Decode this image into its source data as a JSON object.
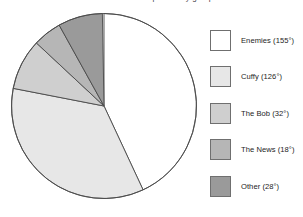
{
  "figure": {
    "caption_fragment": "distribution of responses by group",
    "background": "#ffffff"
  },
  "chart_data": {
    "type": "pie",
    "title": "",
    "xlabel": "",
    "ylabel": "",
    "units": "degrees",
    "start_angle_deg": 0,
    "direction": "clockwise",
    "total_degrees": 359,
    "grid": false,
    "legend_position": "right",
    "categories": [
      "Enemies",
      "Cuffy",
      "The Bob",
      "The News",
      "Other"
    ],
    "values": [
      155,
      126,
      32,
      18,
      28
    ],
    "value_labels": [
      "155°",
      "126°",
      "32°",
      "18°",
      "28°"
    ],
    "colors": [
      "#ffffff",
      "#e7e7e7",
      "#cfcfcf",
      "#b6b6b6",
      "#9a9a9a"
    ],
    "slice_edge_color": "#4a4a4a",
    "slices": [
      {
        "label": "Enemies",
        "degrees": 155,
        "legend_text": "Enemies (155°)",
        "color": "#ffffff"
      },
      {
        "label": "Cuffy",
        "degrees": 126,
        "legend_text": "Cuffy (126°)",
        "color": "#e7e7e7"
      },
      {
        "label": "The Bob",
        "degrees": 32,
        "legend_text": "The Bob (32°)",
        "color": "#cfcfcf"
      },
      {
        "label": "The News",
        "degrees": 18,
        "legend_text": "The News (18°)",
        "color": "#b6b6b6"
      },
      {
        "label": "Other",
        "degrees": 28,
        "legend_text": "Other (28°)",
        "color": "#9a9a9a"
      }
    ]
  },
  "legend": {
    "items": [
      {
        "text": "Enemies (155°)",
        "color": "#ffffff"
      },
      {
        "text": "Cuffy (126°)",
        "color": "#e7e7e7"
      },
      {
        "text": "The Bob (32°)",
        "color": "#cfcfcf"
      },
      {
        "text": "The News (18°)",
        "color": "#b6b6b6"
      },
      {
        "text": "Other (28°)",
        "color": "#9a9a9a"
      }
    ]
  }
}
